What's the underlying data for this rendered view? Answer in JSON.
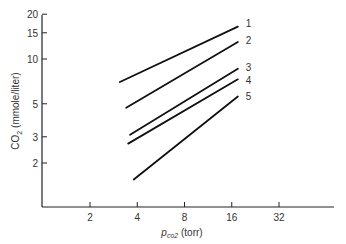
{
  "chart_data": {
    "type": "line",
    "title": "",
    "xlabel_main": "p",
    "xlabel_sub": "co2",
    "xlabel_unit": "(torr)",
    "ylabel_main": "CO",
    "ylabel_sub": "2",
    "ylabel_unit": "(mmole/liter)",
    "x_scale": "log",
    "y_scale": "log",
    "x_ticks": [
      2,
      4,
      8,
      16,
      32
    ],
    "y_ticks": [
      2,
      3,
      5,
      10,
      15,
      20
    ],
    "grid": false,
    "legend": "inline labels at right end of each line",
    "series": [
      {
        "name": "1",
        "x": [
          3.1,
          17.5
        ],
        "y": [
          7.0,
          16.5
        ]
      },
      {
        "name": "2",
        "x": [
          3.4,
          17.5
        ],
        "y": [
          4.7,
          13.0
        ]
      },
      {
        "name": "3",
        "x": [
          3.6,
          17.5
        ],
        "y": [
          3.1,
          8.6
        ]
      },
      {
        "name": "4",
        "x": [
          3.5,
          17.5
        ],
        "y": [
          2.7,
          7.3
        ]
      },
      {
        "name": "5",
        "x": [
          3.8,
          17.5
        ],
        "y": [
          1.55,
          5.6
        ]
      }
    ]
  }
}
